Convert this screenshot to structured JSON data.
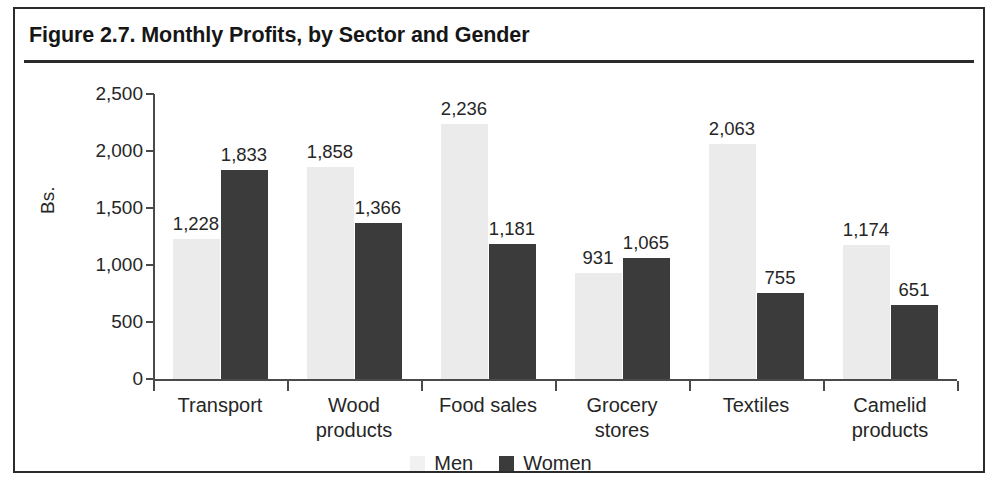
{
  "figure": {
    "title": "Figure 2.7. Monthly Profits, by Sector and Gender"
  },
  "legend": {
    "men_label": "Men",
    "women_label": "Women",
    "men_color": "#ebebeb",
    "women_color": "#3b3b3b"
  },
  "chart_data": {
    "type": "bar",
    "title": "Figure 2.7. Monthly Profits, by Sector and Gender",
    "xlabel": "",
    "ylabel": "Bs.",
    "ylim": [
      0,
      2500
    ],
    "yticks": [
      0,
      500,
      1000,
      1500,
      2000,
      2500
    ],
    "ytick_labels": [
      "0",
      "500",
      "1,000",
      "1,500",
      "2,000",
      "2,500"
    ],
    "grid": false,
    "legend_position": "bottom-center",
    "categories": [
      "Transport",
      "Wood products",
      "Food sales",
      "Grocery stores",
      "Textiles",
      "Camelid products"
    ],
    "category_lines": [
      [
        "Transport"
      ],
      [
        "Wood",
        "products"
      ],
      [
        "Food sales"
      ],
      [
        "Grocery",
        "stores"
      ],
      [
        "Textiles"
      ],
      [
        "Camelid",
        "products"
      ]
    ],
    "series": [
      {
        "name": "Men",
        "color": "#ebebeb",
        "values": [
          1228,
          1858,
          2236,
          931,
          2063,
          1174
        ],
        "labels": [
          "1,228",
          "1,858",
          "2,236",
          "931",
          "2,063",
          "1,174"
        ]
      },
      {
        "name": "Women",
        "color": "#3b3b3b",
        "values": [
          1833,
          1366,
          1181,
          1065,
          755,
          651
        ],
        "labels": [
          "1,833",
          "1,366",
          "1,181",
          "1,065",
          "755",
          "651"
        ]
      }
    ]
  }
}
